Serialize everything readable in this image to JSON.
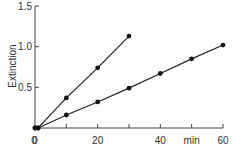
{
  "chart_data": {
    "type": "line",
    "title": "",
    "xlabel": "min",
    "ylabel": "Extinction",
    "xlim": [
      0,
      60
    ],
    "ylim": [
      0,
      1.5
    ],
    "x_ticks": [
      0,
      10,
      20,
      30,
      40,
      50,
      60
    ],
    "x_tick_labels": [
      "0",
      "",
      "20",
      "",
      "40",
      "min",
      "60"
    ],
    "y_ticks": [
      0,
      0.5,
      1.0,
      1.5
    ],
    "y_tick_labels": [
      "0",
      "0.5",
      "1.0",
      "1.5"
    ],
    "grid": false,
    "legend": null,
    "series": [
      {
        "name": "steep",
        "x": [
          0,
          1,
          10,
          20,
          30
        ],
        "values": [
          0,
          0,
          0.37,
          0.74,
          1.13
        ]
      },
      {
        "name": "shallow",
        "x": [
          0,
          1,
          10,
          20,
          30,
          40,
          50,
          60
        ],
        "values": [
          0,
          0,
          0.16,
          0.32,
          0.49,
          0.67,
          0.85,
          1.02
        ]
      }
    ]
  },
  "colors": {
    "line": "#222222",
    "axis": "#444444",
    "marker": "#111111"
  }
}
